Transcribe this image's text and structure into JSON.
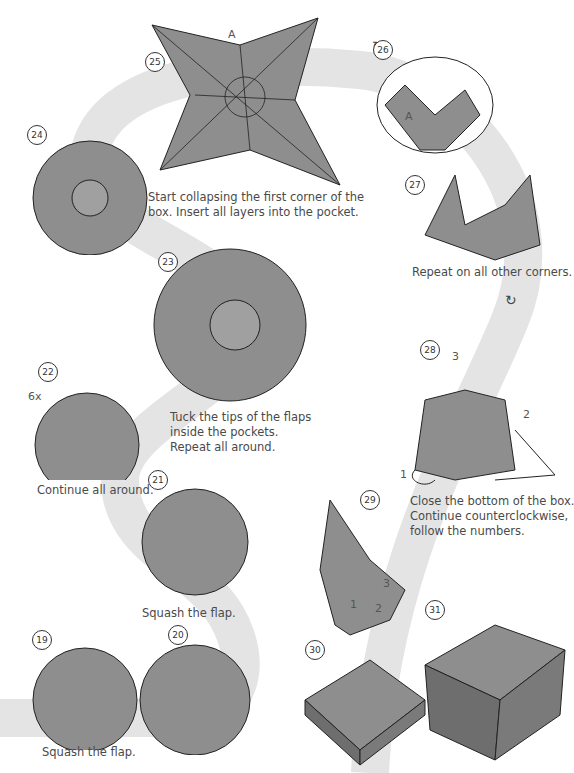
{
  "colors": {
    "background": "#ffffff",
    "path": "#e2e2e2",
    "paper": "#8e8e8e",
    "paper_light": "#b8b8b8",
    "line": "#222222"
  },
  "steps": [
    {
      "number": "19",
      "caption": "Squash the flap."
    },
    {
      "number": "20",
      "caption": ""
    },
    {
      "number": "21",
      "caption": "Squash the flap."
    },
    {
      "number": "22",
      "caption": "Continue all around.",
      "label": "6x"
    },
    {
      "number": "23",
      "caption": "Tuck the tips of the flaps\ninside the pockets.\nRepeat all around."
    },
    {
      "number": "24",
      "caption": ""
    },
    {
      "number": "25",
      "caption": "Start collapsing the first corner of the\nbox. Insert all layers into the pocket.",
      "label": "A"
    },
    {
      "number": "26",
      "caption": "",
      "label": "A"
    },
    {
      "number": "27",
      "caption": "Repeat on all other corners."
    },
    {
      "number": "28",
      "caption": "Close the bottom of the box.\nContinue counterclockwise,\nfollow the numbers.",
      "labels": [
        "1",
        "2",
        "3"
      ]
    },
    {
      "number": "29",
      "caption": "",
      "labels": [
        "1",
        "2",
        "3"
      ]
    },
    {
      "number": "30",
      "caption": ""
    },
    {
      "number": "31",
      "caption": ""
    }
  ],
  "icons": {
    "rotate_1": "↻",
    "rotate_2": "↻"
  }
}
